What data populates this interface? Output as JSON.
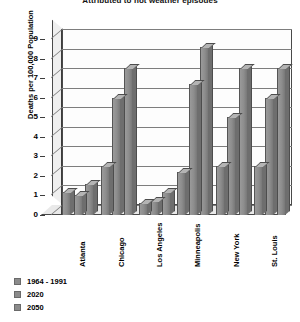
{
  "chart_data": {
    "type": "bar",
    "title": "Attributed to hot weather episodes",
    "xlabel": "",
    "ylabel": "Deaths per 100,000 Population",
    "ylim": [
      0,
      9
    ],
    "yticks": [
      0,
      1,
      2,
      3,
      4,
      5,
      6,
      7,
      8,
      9
    ],
    "grid": true,
    "legend_position": "bottom-left",
    "categories": [
      "Atlanta",
      "Chicago",
      "Los Angeles",
      "Minneapolis",
      "New York",
      "St. Louis"
    ],
    "series": [
      {
        "name": "1964 - 1991",
        "color": "#8b8b8b",
        "values": [
          1.2,
          2.5,
          0.6,
          2.2,
          2.5,
          2.5
        ]
      },
      {
        "name": "2020",
        "color": "#8b8b8b",
        "values": [
          1.0,
          6.0,
          0.7,
          6.7,
          5.0,
          6.0
        ]
      },
      {
        "name": "2050",
        "color": "#8b8b8b",
        "values": [
          1.6,
          7.5,
          1.2,
          8.6,
          7.5,
          7.5
        ]
      }
    ]
  },
  "axis": {
    "y_title": "Deaths per 100,000 Population"
  },
  "legend": {
    "items": [
      {
        "label": "1964 - 1991"
      },
      {
        "label": "2020"
      },
      {
        "label": "2050"
      }
    ]
  }
}
